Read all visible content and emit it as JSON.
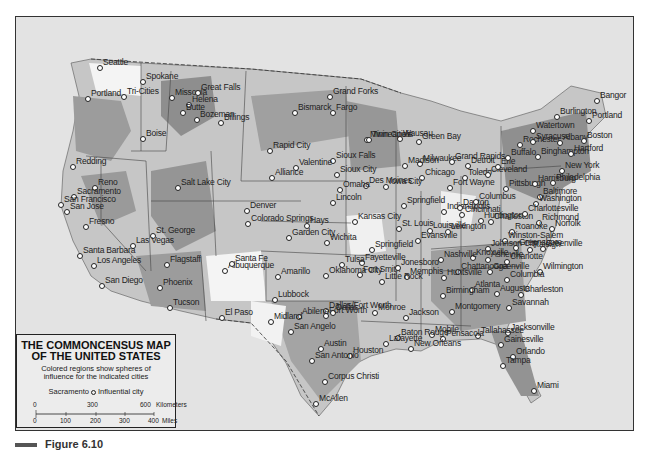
{
  "map": {
    "title_line1": "THE COMMONCENSUS MAP",
    "title_line2": "OF THE UNITED STATES",
    "subtitle_line1": "Colored regions show spheres of",
    "subtitle_line2": "influence for the indicated cities",
    "legend_example_city": "Sacramento",
    "legend_example_label": "Influential city",
    "scale": {
      "km_ticks": [
        "0",
        "300",
        "600"
      ],
      "km_unit": "Kilometers",
      "mile_ticks": [
        "0",
        "100",
        "200",
        "300",
        "400"
      ],
      "mile_unit": "Miles"
    },
    "caption": "Figure 6.10",
    "colors": {
      "frame": "#333333",
      "water": "#e3e3e3",
      "region_dark": "#8a8a8a",
      "region_mid": "#a6a6a6",
      "region_light": "#c4c4c4",
      "region_white": "#f5f5f5"
    },
    "cities": [
      {
        "name": "Seattle",
        "x": 100,
        "y": 68
      },
      {
        "name": "Spokane",
        "x": 143,
        "y": 82
      },
      {
        "name": "Tri-Cities",
        "x": 124,
        "y": 97
      },
      {
        "name": "Portland",
        "x": 88,
        "y": 99
      },
      {
        "name": "Missoula",
        "x": 172,
        "y": 98
      },
      {
        "name": "Great Falls",
        "x": 198,
        "y": 93
      },
      {
        "name": "Helena",
        "x": 189,
        "y": 105
      },
      {
        "name": "Butte",
        "x": 183,
        "y": 113
      },
      {
        "name": "Bozeman",
        "x": 197,
        "y": 120
      },
      {
        "name": "Billings",
        "x": 221,
        "y": 123
      },
      {
        "name": "Boise",
        "x": 143,
        "y": 139
      },
      {
        "name": "Redding",
        "x": 73,
        "y": 167
      },
      {
        "name": "Reno",
        "x": 95,
        "y": 188
      },
      {
        "name": "Sacramento",
        "x": 74,
        "y": 197
      },
      {
        "name": "San Francisco",
        "x": 61,
        "y": 205
      },
      {
        "name": "San Jose",
        "x": 67,
        "y": 212
      },
      {
        "name": "Fresno",
        "x": 86,
        "y": 227
      },
      {
        "name": "Salt Lake City",
        "x": 178,
        "y": 188
      },
      {
        "name": "St. George",
        "x": 153,
        "y": 236
      },
      {
        "name": "Las Vegas",
        "x": 133,
        "y": 246
      },
      {
        "name": "Santa Barbara",
        "x": 80,
        "y": 256
      },
      {
        "name": "Los Angeles",
        "x": 94,
        "y": 266
      },
      {
        "name": "San Diego",
        "x": 102,
        "y": 286
      },
      {
        "name": "Flagstaff",
        "x": 167,
        "y": 265
      },
      {
        "name": "Phoenix",
        "x": 160,
        "y": 288
      },
      {
        "name": "Tucson",
        "x": 170,
        "y": 308
      },
      {
        "name": "Denver",
        "x": 247,
        "y": 211
      },
      {
        "name": "Colorado Springs",
        "x": 248,
        "y": 224
      },
      {
        "name": "Albuquerque",
        "x": 225,
        "y": 271
      },
      {
        "name": "Santa Fe",
        "x": 232,
        "y": 264
      },
      {
        "name": "Grand Forks",
        "x": 330,
        "y": 97
      },
      {
        "name": "Bismarck",
        "x": 295,
        "y": 113
      },
      {
        "name": "Fargo",
        "x": 333,
        "y": 113
      },
      {
        "name": "Rapid City",
        "x": 270,
        "y": 151
      },
      {
        "name": "Sioux Falls",
        "x": 333,
        "y": 161
      },
      {
        "name": "Valentine",
        "x": 296,
        "y": 168
      },
      {
        "name": "Alliance",
        "x": 272,
        "y": 178
      },
      {
        "name": "Minneapolis",
        "x": 367,
        "y": 140
      },
      {
        "name": "Twin Cities",
        "x": 369,
        "y": 140
      },
      {
        "name": "Wausau",
        "x": 400,
        "y": 139
      },
      {
        "name": "Green Bay",
        "x": 419,
        "y": 142
      },
      {
        "name": "Milwaukee",
        "x": 420,
        "y": 164
      },
      {
        "name": "Madison",
        "x": 405,
        "y": 166
      },
      {
        "name": "Grand Rapids",
        "x": 452,
        "y": 162
      },
      {
        "name": "Detroit",
        "x": 468,
        "y": 166
      },
      {
        "name": "Sioux City",
        "x": 337,
        "y": 175
      },
      {
        "name": "Des Moines",
        "x": 366,
        "y": 186
      },
      {
        "name": "Omaha",
        "x": 340,
        "y": 190
      },
      {
        "name": "Lincoln",
        "x": 333,
        "y": 203
      },
      {
        "name": "Chicago",
        "x": 422,
        "y": 178
      },
      {
        "name": "Iowa City",
        "x": 386,
        "y": 187
      },
      {
        "name": "Fort Wayne",
        "x": 450,
        "y": 188
      },
      {
        "name": "Toledo",
        "x": 465,
        "y": 178
      },
      {
        "name": "Kansas City",
        "x": 355,
        "y": 222
      },
      {
        "name": "Hays",
        "x": 307,
        "y": 226
      },
      {
        "name": "Wichita",
        "x": 327,
        "y": 243
      },
      {
        "name": "Garden City",
        "x": 289,
        "y": 238
      },
      {
        "name": "Springfield (IL)",
        "x": 404,
        "y": 206
      },
      {
        "name": "St. Louis",
        "x": 399,
        "y": 229
      },
      {
        "name": "Springfield (MO)",
        "x": 372,
        "y": 250
      },
      {
        "name": "Indianapolis",
        "x": 444,
        "y": 212
      },
      {
        "name": "Dayton",
        "x": 460,
        "y": 208
      },
      {
        "name": "Columbus",
        "x": 476,
        "y": 202
      },
      {
        "name": "Cincinnati",
        "x": 462,
        "y": 215
      },
      {
        "name": "Louisville",
        "x": 430,
        "y": 231
      },
      {
        "name": "Evansville",
        "x": 418,
        "y": 241
      },
      {
        "name": "Lexington",
        "x": 448,
        "y": 232
      },
      {
        "name": "Huntington",
        "x": 481,
        "y": 221
      },
      {
        "name": "Charleston (WV)",
        "x": 491,
        "y": 222
      },
      {
        "name": "Pittsburgh",
        "x": 506,
        "y": 189
      },
      {
        "name": "Cleveland",
        "x": 488,
        "y": 175
      },
      {
        "name": "Erie",
        "x": 498,
        "y": 167
      },
      {
        "name": "Buffalo",
        "x": 508,
        "y": 158
      },
      {
        "name": "Rochester",
        "x": 520,
        "y": 145
      },
      {
        "name": "Syracuse",
        "x": 533,
        "y": 142
      },
      {
        "name": "Binghampton",
        "x": 538,
        "y": 157
      },
      {
        "name": "Watertown",
        "x": 533,
        "y": 131
      },
      {
        "name": "Albany",
        "x": 560,
        "y": 143
      },
      {
        "name": "Burlington",
        "x": 557,
        "y": 117
      },
      {
        "name": "Bangor",
        "x": 597,
        "y": 101
      },
      {
        "name": "Portland (ME)",
        "x": 589,
        "y": 121
      },
      {
        "name": "Boston",
        "x": 584,
        "y": 141
      },
      {
        "name": "Hartford",
        "x": 571,
        "y": 154
      },
      {
        "name": "New York",
        "x": 562,
        "y": 171
      },
      {
        "name": "Harrisburg",
        "x": 535,
        "y": 184
      },
      {
        "name": "Philadelphia",
        "x": 553,
        "y": 183
      },
      {
        "name": "Baltimore",
        "x": 540,
        "y": 197
      },
      {
        "name": "Washington",
        "x": 536,
        "y": 204
      },
      {
        "name": "Charlottesville",
        "x": 525,
        "y": 214
      },
      {
        "name": "Richmond",
        "x": 539,
        "y": 223
      },
      {
        "name": "Roanoke",
        "x": 512,
        "y": 232
      },
      {
        "name": "Norfolk",
        "x": 552,
        "y": 229
      },
      {
        "name": "Winston-Salem",
        "x": 505,
        "y": 241
      },
      {
        "name": "Greensboro",
        "x": 516,
        "y": 248
      },
      {
        "name": "Raleigh",
        "x": 530,
        "y": 250
      },
      {
        "name": "Greenville (NC)",
        "x": 543,
        "y": 249
      },
      {
        "name": "Johnson City",
        "x": 488,
        "y": 249
      },
      {
        "name": "Knoxville",
        "x": 473,
        "y": 258
      },
      {
        "name": "Asheville",
        "x": 488,
        "y": 260
      },
      {
        "name": "Charlotte",
        "x": 507,
        "y": 262
      },
      {
        "name": "Wilmington",
        "x": 540,
        "y": 272
      },
      {
        "name": "Nashville",
        "x": 441,
        "y": 260
      },
      {
        "name": "Chattanooga",
        "x": 458,
        "y": 272
      },
      {
        "name": "Greenville (SC)",
        "x": 490,
        "y": 272
      },
      {
        "name": "Columbia",
        "x": 507,
        "y": 280
      },
      {
        "name": "Charleston (SC)",
        "x": 521,
        "y": 295
      },
      {
        "name": "Memphis",
        "x": 407,
        "y": 277
      },
      {
        "name": "Huntsville",
        "x": 444,
        "y": 278
      },
      {
        "name": "Atlanta",
        "x": 472,
        "y": 290
      },
      {
        "name": "Augusta",
        "x": 497,
        "y": 294
      },
      {
        "name": "Birmingham",
        "x": 443,
        "y": 296
      },
      {
        "name": "Montgomery",
        "x": 452,
        "y": 312
      },
      {
        "name": "Savannah",
        "x": 509,
        "y": 308
      },
      {
        "name": "Jacksonville",
        "x": 508,
        "y": 333
      },
      {
        "name": "Tallahassee",
        "x": 478,
        "y": 336
      },
      {
        "name": "Gainesville",
        "x": 501,
        "y": 345
      },
      {
        "name": "Orlando",
        "x": 513,
        "y": 357
      },
      {
        "name": "Tampa",
        "x": 503,
        "y": 366
      },
      {
        "name": "Miami",
        "x": 534,
        "y": 391
      },
      {
        "name": "Pensacola",
        "x": 443,
        "y": 339
      },
      {
        "name": "Mobile",
        "x": 432,
        "y": 335
      },
      {
        "name": "New Orleans",
        "x": 411,
        "y": 349
      },
      {
        "name": "Baton Rouge",
        "x": 398,
        "y": 338
      },
      {
        "name": "Lafayette",
        "x": 386,
        "y": 344
      },
      {
        "name": "Jackson",
        "x": 406,
        "y": 318
      },
      {
        "name": "Monroe",
        "x": 375,
        "y": 313
      },
      {
        "name": "Little Rock",
        "x": 382,
        "y": 282
      },
      {
        "name": "Fort Smith",
        "x": 360,
        "y": 275
      },
      {
        "name": "Fayetteville",
        "x": 362,
        "y": 263
      },
      {
        "name": "Jonesboro",
        "x": 398,
        "y": 268
      },
      {
        "name": "Tulsa",
        "x": 342,
        "y": 265
      },
      {
        "name": "Oklahoma City",
        "x": 326,
        "y": 276
      },
      {
        "name": "Amarillo",
        "x": 278,
        "y": 277
      },
      {
        "name": "Lubbock",
        "x": 275,
        "y": 300
      },
      {
        "name": "Dallas/Fort Worth",
        "x": 326,
        "y": 311
      },
      {
        "name": "Dallas",
        "x": 333,
        "y": 313
      },
      {
        "name": "Fort Worth",
        "x": 326,
        "y": 316
      },
      {
        "name": "Abilene",
        "x": 299,
        "y": 317
      },
      {
        "name": "Midland",
        "x": 271,
        "y": 322
      },
      {
        "name": "San Angelo",
        "x": 291,
        "y": 332
      },
      {
        "name": "El Paso",
        "x": 222,
        "y": 318
      },
      {
        "name": "Austin",
        "x": 321,
        "y": 349
      },
      {
        "name": "Houston",
        "x": 350,
        "y": 356
      },
      {
        "name": "San Antonio",
        "x": 312,
        "y": 361
      },
      {
        "name": "Corpus Christi",
        "x": 325,
        "y": 382
      },
      {
        "name": "McAllen",
        "x": 316,
        "y": 404
      }
    ]
  }
}
